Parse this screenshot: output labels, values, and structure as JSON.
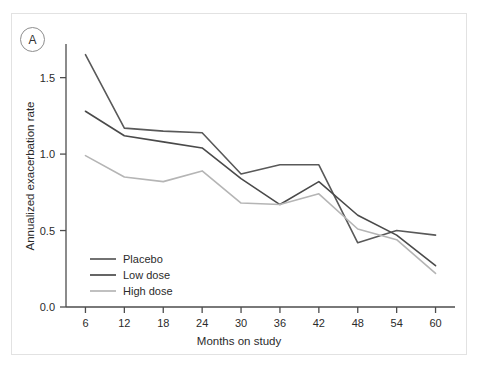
{
  "panel": {
    "label": "A"
  },
  "chart_data": {
    "type": "line",
    "title": "",
    "xlabel": "Months on study",
    "ylabel": "Annualized exacerbation rate",
    "x": [
      6,
      12,
      18,
      24,
      30,
      36,
      42,
      48,
      54,
      60
    ],
    "xtick_labels": [
      "6",
      "12",
      "18",
      "24",
      "30",
      "36",
      "42",
      "48",
      "54",
      "60"
    ],
    "ytick_labels": [
      "0.0",
      "0.5",
      "1.0",
      "1.5"
    ],
    "yticks": [
      0.0,
      0.5,
      1.0,
      1.5
    ],
    "xlim": [
      3,
      63
    ],
    "ylim": [
      0.0,
      1.72
    ],
    "grid": false,
    "legend_position": "bottom-left",
    "series": [
      {
        "name": "Placebo",
        "color": "#595959",
        "values": [
          1.65,
          1.17,
          1.15,
          1.14,
          0.87,
          0.93,
          0.93,
          0.42,
          0.5,
          0.47
        ]
      },
      {
        "name": "Low dose",
        "color": "#4a4a4a",
        "values": [
          1.28,
          1.12,
          1.08,
          1.04,
          0.84,
          0.67,
          0.82,
          0.6,
          0.47,
          0.27
        ]
      },
      {
        "name": "High dose",
        "color": "#b5b5b5",
        "values": [
          0.99,
          0.85,
          0.82,
          0.89,
          0.68,
          0.67,
          0.74,
          0.51,
          0.44,
          0.22
        ]
      }
    ]
  },
  "legend": {
    "items": [
      {
        "label": "Placebo",
        "color": "#595959"
      },
      {
        "label": "Low dose",
        "color": "#4a4a4a"
      },
      {
        "label": "High dose",
        "color": "#b5b5b5"
      }
    ]
  }
}
